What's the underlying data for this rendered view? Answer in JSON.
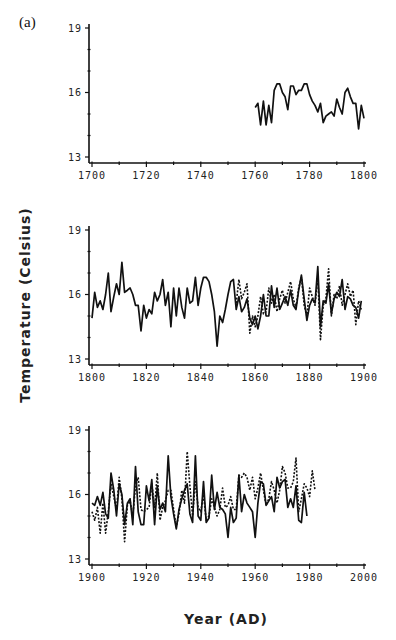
{
  "figure": {
    "panel_label": "(a)",
    "ylabel": "Temperature  (Celsius)",
    "xlabel": "Year  (AD)"
  },
  "chart_data": [
    {
      "type": "line",
      "title": "",
      "xlabel": "Year (AD)",
      "ylabel": "Temperature (Celsius)",
      "xlim": [
        1700,
        1800
      ],
      "ylim": [
        13,
        19
      ],
      "xticks": [
        1700,
        1720,
        1740,
        1760,
        1780,
        1800
      ],
      "yticks": [
        13,
        16,
        19
      ],
      "grid": false,
      "series": [
        {
          "name": "solid",
          "style": "solid",
          "x": [
            1760,
            1761,
            1762,
            1763,
            1764,
            1765,
            1766,
            1767,
            1768,
            1769,
            1770,
            1771,
            1772,
            1773,
            1774,
            1775,
            1776,
            1777,
            1778,
            1779,
            1780,
            1781,
            1782,
            1783,
            1784,
            1785,
            1786,
            1787,
            1788,
            1789,
            1790,
            1791,
            1792,
            1793,
            1794,
            1795,
            1796,
            1797,
            1798,
            1799,
            1800
          ],
          "values": [
            15.3,
            15.5,
            14.5,
            15.6,
            14.5,
            15.4,
            14.6,
            16.1,
            16.4,
            16.4,
            16.0,
            15.8,
            15.2,
            16.3,
            16.3,
            15.9,
            16.1,
            16.1,
            16.4,
            16.4,
            15.9,
            15.6,
            15.4,
            15.1,
            15.5,
            14.6,
            14.9,
            15.0,
            15.1,
            14.9,
            15.7,
            15.3,
            15.0,
            16.0,
            16.2,
            15.8,
            15.5,
            15.5,
            14.3,
            15.4,
            14.8
          ]
        }
      ]
    },
    {
      "type": "line",
      "title": "",
      "xlabel": "Year (AD)",
      "ylabel": "Temperature (Celsius)",
      "xlim": [
        1800,
        1900
      ],
      "ylim": [
        13,
        19
      ],
      "xticks": [
        1800,
        1820,
        1840,
        1860,
        1880,
        1900
      ],
      "yticks": [
        13,
        16,
        19
      ],
      "grid": false,
      "series": [
        {
          "name": "solid",
          "style": "solid",
          "x": [
            1800,
            1801,
            1802,
            1803,
            1804,
            1805,
            1806,
            1807,
            1808,
            1809,
            1810,
            1811,
            1812,
            1813,
            1814,
            1815,
            1816,
            1817,
            1818,
            1819,
            1820,
            1821,
            1822,
            1823,
            1824,
            1825,
            1826,
            1827,
            1828,
            1829,
            1830,
            1831,
            1832,
            1833,
            1834,
            1835,
            1836,
            1837,
            1838,
            1839,
            1840,
            1841,
            1842,
            1843,
            1844,
            1845,
            1846,
            1847,
            1848,
            1849,
            1850,
            1851,
            1852,
            1853,
            1854,
            1855,
            1856,
            1857,
            1858,
            1859,
            1860,
            1861,
            1862,
            1863,
            1864,
            1865,
            1866,
            1867,
            1868,
            1869,
            1870,
            1871,
            1872,
            1873,
            1874,
            1875,
            1876,
            1877,
            1878,
            1879,
            1880,
            1881,
            1882,
            1883,
            1884,
            1885,
            1886,
            1887,
            1888,
            1889,
            1890,
            1891,
            1892,
            1893,
            1894,
            1895,
            1896,
            1897,
            1898,
            1899
          ],
          "values": [
            14.9,
            16.1,
            15.4,
            15.7,
            15.3,
            16.0,
            17.0,
            15.2,
            15.9,
            16.5,
            16.0,
            17.5,
            16.1,
            16.2,
            16.3,
            16.0,
            15.5,
            15.5,
            14.3,
            15.5,
            14.9,
            15.3,
            15.1,
            16.1,
            15.7,
            16.0,
            16.7,
            15.5,
            16.1,
            14.5,
            16.3,
            15.0,
            16.3,
            15.4,
            14.9,
            16.3,
            15.6,
            15.7,
            16.8,
            15.5,
            16.3,
            16.8,
            16.8,
            16.6,
            16.0,
            15.2,
            13.6,
            15.0,
            14.7,
            15.3,
            16.0,
            16.6,
            16.7,
            15.3,
            15.9,
            15.2,
            15.4,
            15.8,
            14.9,
            14.6,
            15.0,
            14.4,
            15.0,
            16.0,
            15.0,
            15.0,
            16.4,
            15.4,
            16.3,
            15.3,
            15.6,
            15.9,
            15.5,
            16.2,
            15.5,
            15.3,
            16.2,
            16.9,
            15.8,
            14.8,
            15.5,
            15.8,
            15.6,
            17.3,
            14.5,
            15.7,
            15.6,
            16.5,
            15.1,
            15.8,
            16.1,
            15.9,
            16.7,
            15.3,
            15.9,
            15.8,
            15.5,
            15.4,
            14.9,
            15.7
          ]
        },
        {
          "name": "dashed",
          "style": "dashed",
          "x": [
            1853,
            1854,
            1855,
            1856,
            1857,
            1858,
            1859,
            1860,
            1861,
            1862,
            1863,
            1864,
            1865,
            1866,
            1867,
            1868,
            1869,
            1870,
            1871,
            1872,
            1873,
            1874,
            1875,
            1876,
            1877,
            1878,
            1879,
            1880,
            1881,
            1882,
            1883,
            1884,
            1885,
            1886,
            1887,
            1888,
            1889,
            1890,
            1891,
            1892,
            1893,
            1894,
            1895,
            1896,
            1897,
            1898,
            1899
          ],
          "values": [
            15.6,
            16.7,
            15.8,
            16.1,
            16.5,
            14.2,
            15.0,
            14.5,
            15.0,
            15.9,
            15.1,
            15.2,
            16.3,
            15.6,
            16.0,
            15.2,
            15.8,
            16.2,
            15.6,
            16.1,
            16.6,
            15.8,
            15.4,
            16.3,
            16.8,
            15.5,
            15.0,
            16.3,
            15.9,
            15.5,
            16.8,
            13.9,
            15.5,
            15.8,
            17.2,
            15.0,
            16.0,
            15.8,
            16.4,
            15.5,
            16.0,
            16.5,
            15.9,
            16.2,
            14.6,
            15.7,
            15.3
          ]
        }
      ]
    },
    {
      "type": "line",
      "title": "",
      "xlabel": "Year (AD)",
      "ylabel": "Temperature (Celsius)",
      "xlim": [
        1900,
        2000
      ],
      "ylim": [
        13,
        19
      ],
      "xticks": [
        1900,
        1920,
        1940,
        1960,
        1980,
        2000
      ],
      "yticks": [
        13,
        16,
        19
      ],
      "grid": false,
      "series": [
        {
          "name": "solid",
          "style": "solid",
          "x": [
            1900,
            1901,
            1902,
            1903,
            1904,
            1905,
            1906,
            1907,
            1908,
            1909,
            1910,
            1911,
            1912,
            1913,
            1914,
            1915,
            1916,
            1917,
            1918,
            1919,
            1920,
            1921,
            1922,
            1923,
            1924,
            1925,
            1926,
            1927,
            1928,
            1929,
            1930,
            1931,
            1932,
            1933,
            1934,
            1935,
            1936,
            1937,
            1938,
            1939,
            1940,
            1941,
            1942,
            1943,
            1944,
            1945,
            1946,
            1947,
            1948,
            1949,
            1950,
            1951,
            1952,
            1953,
            1954,
            1955,
            1956,
            1957,
            1958,
            1959,
            1960,
            1961,
            1962,
            1963,
            1964,
            1965,
            1966,
            1967,
            1968,
            1969,
            1970,
            1971,
            1972,
            1973,
            1974,
            1975,
            1976,
            1977,
            1978,
            1979
          ],
          "values": [
            15.6,
            15.5,
            15.9,
            15.5,
            16.1,
            15.1,
            14.9,
            17.0,
            16.2,
            15.0,
            16.5,
            16.0,
            14.6,
            15.6,
            15.8,
            14.6,
            17.3,
            15.2,
            14.6,
            14.6,
            16.4,
            15.7,
            16.7,
            14.6,
            16.4,
            15.3,
            15.6,
            15.2,
            17.8,
            15.9,
            15.1,
            14.4,
            15.3,
            15.8,
            16.2,
            16.5,
            15.1,
            14.7,
            17.8,
            15.0,
            14.8,
            16.6,
            14.7,
            14.9,
            16.9,
            15.3,
            16.1,
            15.4,
            15.3,
            15.1,
            14.0,
            15.4,
            14.7,
            14.9,
            16.9,
            15.2,
            16.0,
            15.6,
            15.4,
            15.2,
            14.0,
            15.6,
            16.6,
            16.5,
            15.5,
            15.7,
            15.9,
            15.2,
            16.8,
            16.3,
            16.6,
            16.7,
            15.4,
            15.8,
            15.4,
            16.4,
            14.8,
            14.7,
            16.1,
            15.0
          ]
        },
        {
          "name": "dashed",
          "style": "dashed",
          "x": [
            1900,
            1901,
            1902,
            1903,
            1904,
            1905,
            1906,
            1907,
            1908,
            1909,
            1910,
            1911,
            1912,
            1913,
            1914,
            1915,
            1916,
            1917,
            1918,
            1919,
            1920,
            1921,
            1922,
            1923,
            1924,
            1925,
            1926,
            1927,
            1928,
            1929,
            1930,
            1931,
            1932,
            1933,
            1934,
            1935,
            1936,
            1937,
            1938,
            1939,
            1940,
            1941,
            1942,
            1943,
            1944,
            1945,
            1946,
            1947,
            1948,
            1949,
            1950,
            1951,
            1952,
            1953,
            1954,
            1955,
            1956,
            1957,
            1958,
            1959,
            1960,
            1961,
            1962,
            1963,
            1964,
            1965,
            1966,
            1967,
            1968,
            1969,
            1970,
            1971,
            1972,
            1973,
            1974,
            1975,
            1976,
            1977,
            1978,
            1979,
            1980,
            1981,
            1982
          ],
          "values": [
            15.2,
            14.8,
            15.4,
            14.2,
            15.6,
            14.2,
            15.2,
            16.5,
            15.9,
            15.3,
            16.8,
            15.8,
            13.8,
            15.5,
            15.7,
            15.0,
            16.4,
            16.8,
            15.3,
            15.2,
            15.3,
            15.4,
            16.5,
            15.4,
            17.0,
            14.8,
            15.4,
            15.7,
            16.2,
            16.2,
            15.3,
            14.5,
            15.1,
            16.2,
            15.6,
            18.0,
            16.4,
            15.0,
            16.6,
            15.4,
            15.2,
            16.0,
            14.8,
            15.0,
            15.8,
            15.4,
            15.0,
            15.3,
            16.3,
            15.4,
            15.5,
            15.9,
            15.3,
            15.3,
            16.9,
            16.8,
            17.0,
            16.8,
            16.2,
            16.8,
            15.8,
            16.3,
            17.0,
            16.2,
            15.5,
            15.8,
            16.6,
            16.2,
            15.6,
            16.2,
            17.3,
            17.0,
            16.3,
            16.3,
            16.6,
            17.7,
            15.2,
            15.8,
            16.5,
            16.3,
            15.9,
            17.1,
            16.2
          ]
        }
      ]
    }
  ]
}
